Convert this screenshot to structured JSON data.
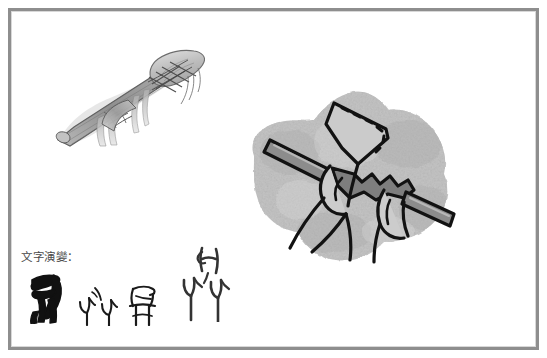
{
  "page": {
    "background_color": "#ffffff",
    "width": 547,
    "height": 358
  },
  "frame": {
    "border_color": "#8e8e8e",
    "inner_highlight_color": "#d8d8d8"
  },
  "caption": {
    "evolution_label": "文字演變："
  },
  "illustrations": {
    "pencil_sketch": {
      "name": "hafted-stone-axe-pencil-sketch",
      "description": "Pencil sketch of a primitive stone blade lashed with cord to a wooden handle",
      "stroke_color": "#5a5a5a",
      "shade_color": "#9a9a9a"
    },
    "ink_drawing": {
      "name": "hands-gripping-axe-ink-drawing",
      "description": "Bold ink drawing of two hands gripping a fan-shaped blade with a serrated bar, on a rough grey stone background",
      "stone_color_light": "#cfcfcf",
      "stone_color_mid": "#b4b4b4",
      "stone_color_dark": "#9c9c9c",
      "ink_color": "#1a1a1a",
      "blade_fill": "#c8c8c8",
      "bar_fill": "#8a8a8a"
    }
  },
  "glyphs": [
    {
      "id": "glyph-oracle-bone",
      "script": "甲骨文",
      "stroke_color": "#111111",
      "weight": "bold"
    },
    {
      "id": "glyph-bronze",
      "script": "金文",
      "stroke_color": "#1a1a1a",
      "weight": "thin"
    },
    {
      "id": "glyph-seal",
      "script": "小篆",
      "stroke_color": "#1a1a1a",
      "weight": "medium"
    },
    {
      "id": "glyph-large-variant",
      "script": "變體",
      "stroke_color": "#333333",
      "weight": "medium"
    }
  ]
}
